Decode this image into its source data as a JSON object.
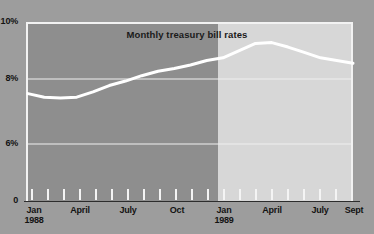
{
  "chart_data": {
    "type": "area",
    "title": "Monthly treasury bill rates",
    "xlabel": "",
    "ylabel": "",
    "ylim": [
      0,
      10
    ],
    "ytick_values": [
      0,
      6,
      8,
      10
    ],
    "ytick_labels": [
      "0",
      "6%",
      "8%",
      "10%"
    ],
    "grid": true,
    "gridlines_at": [
      6,
      8,
      10
    ],
    "legend": "none",
    "x": [
      "Jan 1988",
      "Feb 1988",
      "Mar 1988",
      "Apr 1988",
      "May 1988",
      "Jun 1988",
      "Jul 1988",
      "Aug 1988",
      "Sep 1988",
      "Oct 1988",
      "Nov 1988",
      "Dec 1988",
      "Jan 1989",
      "Feb 1989",
      "Mar 1989",
      "Apr 1989",
      "May 1989",
      "Jun 1989",
      "Jul 1989",
      "Aug 1989",
      "Sep 1989"
    ],
    "values": [
      6.0,
      5.8,
      5.75,
      5.8,
      6.1,
      6.45,
      6.7,
      7.0,
      7.25,
      7.4,
      7.6,
      7.85,
      8.0,
      8.4,
      8.8,
      8.85,
      8.6,
      8.3,
      8.0,
      7.85,
      7.7
    ],
    "xtick_labels": [
      "Jan 1988",
      "April",
      "July",
      "Oct",
      "Jan 1989",
      "April",
      "July",
      "Sept"
    ],
    "series": [
      {
        "name": "Monthly treasury bill rate",
        "values": [
          6.0,
          5.8,
          5.75,
          5.8,
          6.1,
          6.45,
          6.7,
          7.0,
          7.25,
          7.4,
          7.6,
          7.85,
          8.0,
          8.4,
          8.8,
          8.85,
          8.6,
          8.3,
          8.0,
          7.85,
          7.7
        ]
      }
    ],
    "bands": [
      {
        "label": "1988",
        "start_index": 0,
        "end_index": 12,
        "shade": "dark"
      },
      {
        "label": "1989",
        "start_index": 12,
        "end_index": 20,
        "shade": "light"
      }
    ]
  },
  "axis": {
    "y_labels": [
      {
        "id": "10",
        "text": "10%"
      },
      {
        "id": "8",
        "text": "8%"
      },
      {
        "id": "6",
        "text": "6%"
      },
      {
        "id": "0",
        "text": "0"
      }
    ],
    "x_labels": [
      {
        "id": "jan-1988",
        "line1": "Jan",
        "line2": "1988"
      },
      {
        "id": "april-1988",
        "line1": "April",
        "line2": ""
      },
      {
        "id": "july-1988",
        "line1": "July",
        "line2": ""
      },
      {
        "id": "oct-1988",
        "line1": "Oct",
        "line2": ""
      },
      {
        "id": "jan-1989",
        "line1": "Jan",
        "line2": "1989"
      },
      {
        "id": "april-1989",
        "line1": "April",
        "line2": ""
      },
      {
        "id": "july-1989",
        "line1": "July",
        "line2": ""
      },
      {
        "id": "sept-1989",
        "line1": "Sept",
        "line2": ""
      }
    ]
  },
  "colors": {
    "background": "#9d9d9d",
    "band_1988": "#8e8e8e",
    "band_1989": "#d7d7d7",
    "line": "#ffffff",
    "gridline": "#efefef",
    "frame": "#f2f2f2",
    "text": "#131313"
  }
}
